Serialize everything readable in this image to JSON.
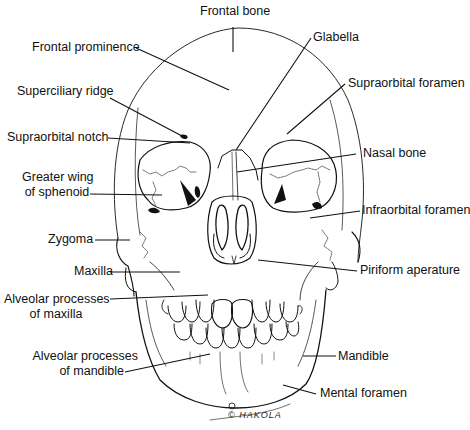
{
  "diagram": {
    "signature": "© HAKOLA",
    "labels": {
      "frontal_bone": "Frontal bone",
      "frontal_prominence": "Frontal prominence",
      "glabella": "Glabella",
      "superciliary_ridge": "Superciliary ridge",
      "supraorbital_foramen": "Supraorbital foramen",
      "supraorbital_notch": "Supraorbital notch",
      "nasal_bone": "Nasal bone",
      "greater_wing_1": "Greater wing",
      "greater_wing_2": "of sphenoid",
      "infraorbital_foramen": "Infraorbital foramen",
      "zygoma": "Zygoma",
      "maxilla": "Maxilla",
      "piriform_aperature": "Piriform aperature",
      "alveolar_maxilla_1": "Alveolar processes",
      "alveolar_maxilla_2": "of maxilla",
      "alveolar_mandible_1": "Alveolar processes",
      "alveolar_mandible_2": "of mandible",
      "mandible": "Mandible",
      "mental_foramen": "Mental foramen"
    }
  }
}
